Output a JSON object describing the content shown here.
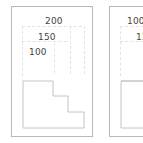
{
  "panels": [
    {
      "labels": [
        "200",
        "150",
        "100"
      ],
      "shape": "stepped-outline"
    },
    {
      "labels": [
        "100",
        "15",
        "2"
      ],
      "shape": "rectangle-outline"
    }
  ],
  "colors": {
    "border": "#b8b8b8",
    "shape_stroke": "#c4c4c4",
    "text": "#444444",
    "guide": "#e3e3e3"
  }
}
